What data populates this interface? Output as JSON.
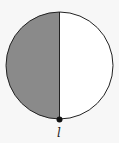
{
  "diagram": {
    "shape": "circle",
    "shaded_half": "left",
    "shade_color": "#8a8a8a",
    "unshaded_color": "#ffffff",
    "stroke_color": "#222222",
    "divider": "vertical diameter",
    "point": {
      "position": "bottom",
      "label": "l"
    }
  }
}
